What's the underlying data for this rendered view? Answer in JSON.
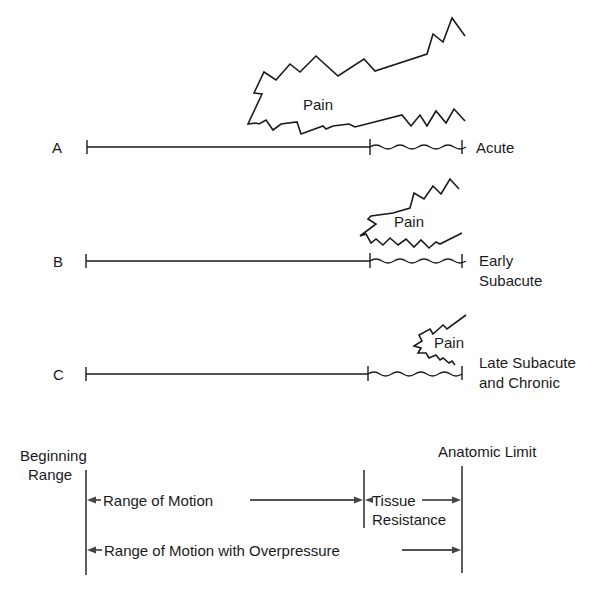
{
  "diagram": {
    "rows": [
      {
        "id": "A",
        "letter": "A",
        "pain_label": "Pain",
        "stage": "Acute",
        "stage_line2": ""
      },
      {
        "id": "B",
        "letter": "B",
        "pain_label": "Pain",
        "stage": "Early",
        "stage_line2": "Subacute"
      },
      {
        "id": "C",
        "letter": "C",
        "pain_label": "Pain",
        "stage": "Late Subacute",
        "stage_line2": "and Chronic"
      }
    ],
    "legend": {
      "beginning_range_line1": "Beginning",
      "beginning_range_line2": "Range",
      "anatomic_limit": "Anatomic Limit",
      "range_of_motion": "Range of Motion",
      "tissue_resistance_line1": "Tissue",
      "tissue_resistance_line2": "Resistance",
      "range_with_overpressure": "Range of Motion with Overpressure"
    },
    "colors": {
      "line": "#1a1a1a",
      "background": "#ffffff"
    }
  }
}
